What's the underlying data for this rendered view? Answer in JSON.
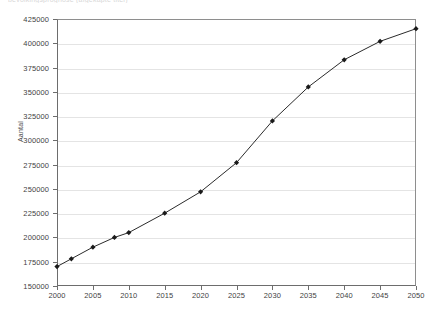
{
  "top_caption": "bevolkingsprognose (afgekapte titel)",
  "chart_data": {
    "type": "line",
    "title": "",
    "xlabel": "",
    "ylabel": "Aantal",
    "xlim": [
      2000,
      2050
    ],
    "ylim": [
      150000,
      425000
    ],
    "grid": true,
    "legend": "none",
    "marker": "diamond",
    "line_color": "#2b2b2b",
    "marker_color": "#1a1a1a",
    "grid_color": "#e4e4e4",
    "axis_color": "#6d6d6d",
    "ytick_labels": [
      "425000",
      "400000",
      "375000",
      "350000",
      "325000",
      "300000",
      "275000",
      "250000",
      "225000",
      "200000",
      "175000",
      "150000"
    ],
    "ytick_values": [
      425000,
      400000,
      375000,
      350000,
      325000,
      300000,
      275000,
      250000,
      225000,
      200000,
      175000,
      150000
    ],
    "xtick_labels": [
      "2000",
      "2005",
      "2010",
      "2015",
      "2020",
      "2025",
      "2030",
      "2035",
      "2040",
      "2045",
      "2050"
    ],
    "xtick_values": [
      2000,
      2005,
      2010,
      2015,
      2020,
      2025,
      2030,
      2035,
      2040,
      2045,
      2050
    ],
    "x": [
      2000,
      2002,
      2005,
      2008,
      2010,
      2015,
      2020,
      2025,
      2030,
      2035,
      2040,
      2045,
      2050
    ],
    "values": [
      170000,
      178000,
      190000,
      200000,
      205000,
      225000,
      247000,
      277000,
      320000,
      355000,
      383000,
      402000,
      415000
    ],
    "series": [
      {
        "name": "Aantal",
        "points": [
          {
            "x": 2000,
            "y": 170000
          },
          {
            "x": 2002,
            "y": 178000
          },
          {
            "x": 2005,
            "y": 190000
          },
          {
            "x": 2008,
            "y": 200000
          },
          {
            "x": 2010,
            "y": 205000
          },
          {
            "x": 2015,
            "y": 225000
          },
          {
            "x": 2020,
            "y": 247000
          },
          {
            "x": 2025,
            "y": 277000
          },
          {
            "x": 2030,
            "y": 320000
          },
          {
            "x": 2035,
            "y": 355000
          },
          {
            "x": 2040,
            "y": 383000
          },
          {
            "x": 2045,
            "y": 402000
          },
          {
            "x": 2050,
            "y": 415000
          }
        ]
      }
    ]
  }
}
